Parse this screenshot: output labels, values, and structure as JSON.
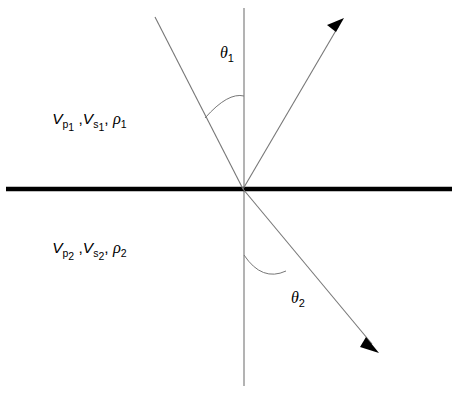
{
  "figure": {
    "name": "seismic-interface-ray-diagram",
    "background_color": "#ffffff",
    "width": 457,
    "height": 395
  },
  "colors": {
    "interface": "#000000",
    "ray": "#777777",
    "normal": "#9a9a9a",
    "arrow": "#000000",
    "text": "#000000"
  },
  "labels": {
    "upper_medium": {
      "vp": "V",
      "vp_sub": "p",
      "vp_sub_index": "1",
      "comma_1": " ,",
      "vs": "V",
      "vs_sub": "s",
      "vs_sub_index": "1",
      "comma_2": ", ",
      "rho": "ρ",
      "rho_sub_index": "1",
      "full": "Vp1 , Vs1, ρ1"
    },
    "lower_medium": {
      "vp": "V",
      "vp_sub": "p",
      "vp_sub_index": "2",
      "comma_1": " ,",
      "vs": "V",
      "vs_sub": "s",
      "vs_sub_index": "2",
      "comma_2": ", ",
      "rho": "ρ",
      "rho_sub_index": "2",
      "full": "Vp2 , Vs2, ρ2"
    },
    "angle_incidence": {
      "symbol": "θ",
      "sub": "1",
      "full": "θ1"
    },
    "angle_transmission": {
      "symbol": "θ",
      "sub": "2",
      "full": "θ2"
    }
  },
  "geometry": {
    "origin": {
      "x": 243,
      "y": 189
    },
    "interface": {
      "x1": 6,
      "y1": 189,
      "x2": 452,
      "y2": 189
    },
    "normal": {
      "x1": 244,
      "y1": 8,
      "x2": 244,
      "y2": 386
    },
    "incident_ray": {
      "x1": 155,
      "y1": 17,
      "x2": 243,
      "y2": 189
    },
    "reflected_ray": {
      "x1": 243,
      "y1": 189,
      "x2": 338,
      "y2": 27
    },
    "transmitted_ray": {
      "x1": 243,
      "y1": 189,
      "x2": 372,
      "y2": 344
    },
    "reflected_arrow_tip": {
      "x": 344,
      "y": 18
    },
    "transmitted_arrow_tip": {
      "x": 379,
      "y": 353
    },
    "arc_upper": {
      "d": "M 205 118 Q 228 92 244 96"
    },
    "arc_lower": {
      "d": "M 244 255 Q 262 282 286 271"
    },
    "label_positions": {
      "upper_medium": {
        "x": 22,
        "y": 124
      },
      "lower_medium": {
        "x": 22,
        "y": 253
      },
      "theta_1": {
        "x": 192,
        "y": 58
      },
      "theta_2": {
        "x": 263,
        "y": 303
      }
    }
  }
}
